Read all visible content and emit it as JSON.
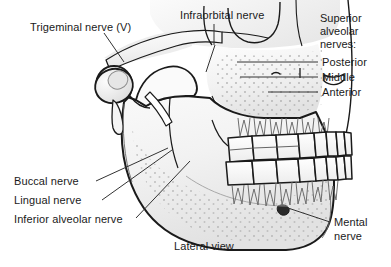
{
  "figure": {
    "caption": "Lateral view",
    "background_color": "#ffffff",
    "ink_color": "#1a1a1a"
  },
  "labels": {
    "trigeminal": "Trigeminal nerve (V)",
    "infraorbital": "Infraorbital nerve",
    "superior_alveolar_head_line1": "Superior",
    "superior_alveolar_head_line2": "alveolar",
    "superior_alveolar_head_line3": "nerves:",
    "posterior": "Posterior",
    "middle": "Middle",
    "anterior": "Anterior",
    "buccal": "Buccal nerve",
    "lingual": "Lingual nerve",
    "inferior_alveolar": "Inferior alveolar nerve",
    "mental_line1": "Mental",
    "mental_line2": "nerve",
    "view": "Lateral view"
  }
}
